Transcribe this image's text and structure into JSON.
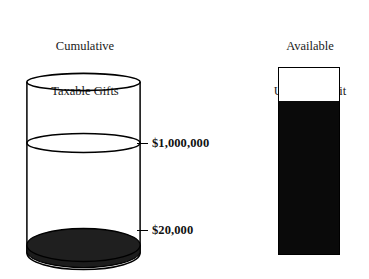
{
  "figure": {
    "type": "diagram",
    "background_color": "#ffffff",
    "ink_color": "#000000"
  },
  "left_panel": {
    "title_line_1": "Cumulative",
    "title_line_2": "Taxable Gifts",
    "shape": "cylinder",
    "fill_color": "#1a1a1a",
    "outline_color": "#000000",
    "fill_label": "$20,000",
    "capacity_label": "$1,000,000",
    "levels": [
      {
        "id": "one-million",
        "label": "$1,000,000",
        "position_pct_from_top": 37
      },
      {
        "id": "twenty-thousand",
        "label": "$20,000",
        "position_pct_from_top": 83
      }
    ]
  },
  "right_panel": {
    "title_line_1": "Available",
    "title_line_2": "Unified Credit",
    "shape": "bar",
    "fill_color": "#0a0a0a",
    "empty_color": "#ffffff",
    "outline_color": "#000000",
    "filled_fraction_pct": 82,
    "empty_fraction_pct": 18
  },
  "chart_data": {
    "type": "bar",
    "title": "",
    "categories": [
      "Cumulative Taxable Gifts",
      "Available Unified Credit"
    ],
    "series": [
      {
        "name": "Used / Filled",
        "values": [
          20000,
          82
        ]
      },
      {
        "name": "Remaining Capacity",
        "values": [
          980000,
          18
        ]
      }
    ],
    "annotations": [
      "$1,000,000",
      "$20,000"
    ],
    "ylabel": "",
    "xlabel": "",
    "grid": false,
    "legend": "none"
  }
}
